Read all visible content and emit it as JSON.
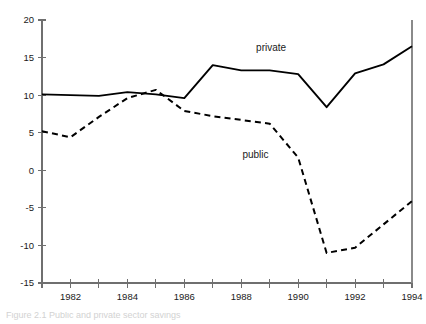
{
  "chart_data": {
    "type": "line",
    "title": "",
    "xlabel": "",
    "ylabel": "",
    "xlim": [
      1981,
      1994
    ],
    "ylim": [
      -15,
      20
    ],
    "grid": false,
    "legend_position": "inline-annotation",
    "x": [
      1981,
      1982,
      1983,
      1984,
      1985,
      1986,
      1987,
      1988,
      1989,
      1990,
      1991,
      1992,
      1993,
      1994
    ],
    "x_tick_values": [
      1981,
      1982,
      1983,
      1984,
      1985,
      1986,
      1987,
      1988,
      1989,
      1990,
      1991,
      1992,
      1993,
      1994
    ],
    "x_tick_labels": [
      "",
      "1982",
      "",
      "1984",
      "",
      "1986",
      "",
      "1988",
      "",
      "1990",
      "",
      "1992",
      "",
      "1994"
    ],
    "y_tick_values": [
      20,
      15,
      10,
      5,
      0,
      -5,
      -10,
      -15
    ],
    "y_tick_labels": [
      "20",
      "15",
      "10",
      "5",
      "0",
      "-5",
      "-10",
      "-15"
    ],
    "series": [
      {
        "name": "private",
        "style": "solid",
        "color": "#000000",
        "label_text": "private",
        "label_x": 1989.05,
        "label_y": 15.9,
        "values": [
          10.1,
          10.0,
          9.9,
          10.4,
          10.1,
          9.6,
          14.0,
          13.3,
          13.3,
          12.8,
          8.4,
          12.9,
          14.1,
          16.5
        ]
      },
      {
        "name": "public",
        "style": "dashed",
        "color": "#000000",
        "label_text": "public",
        "label_x": 1988.5,
        "label_y": 1.6,
        "values": [
          5.2,
          4.4,
          7.1,
          9.6,
          10.7,
          7.9,
          7.2,
          6.7,
          6.2,
          1.7,
          -11.0,
          -10.3,
          -7.2,
          -4.1
        ]
      }
    ]
  },
  "caption": {
    "text": "Figure 2.1   Public and private sector savings",
    "visible": "partially-cropped"
  }
}
